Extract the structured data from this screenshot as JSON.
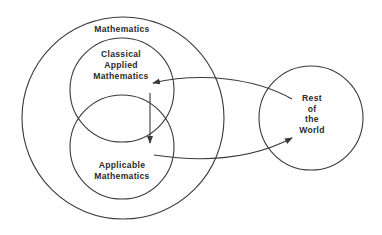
{
  "diagram": {
    "type": "venn-flow",
    "nodes": {
      "mathematics": {
        "label": "Mathematics"
      },
      "classical_applied": {
        "lines": [
          "Classical",
          "Applied",
          "Mathematics"
        ]
      },
      "applicable": {
        "lines": [
          "Applicable",
          "Mathematics"
        ]
      },
      "rest_of_world": {
        "lines": [
          "Rest",
          "of",
          "the",
          "World"
        ]
      }
    },
    "edges": [
      {
        "from": "Rest of the World",
        "to": "Classical Applied Mathematics"
      },
      {
        "from": "Classical Applied Mathematics",
        "to": "Applicable Mathematics"
      },
      {
        "from": "Applicable Mathematics",
        "to": "Rest of the World"
      }
    ],
    "colors": {
      "stroke": "#3a3a3a",
      "text": "#2a2a2a",
      "background": "#ffffff"
    }
  }
}
